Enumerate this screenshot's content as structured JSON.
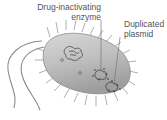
{
  "diagram": {
    "labels": {
      "enzyme": "Drug-inactivating enzyme",
      "enzyme_line1": "Drug-inactivating",
      "enzyme_line2": "enzyme",
      "plasmid_line1": "Duplicated",
      "plasmid_line2": "plasmid"
    },
    "elements": [
      "cell-body",
      "pili",
      "flagella",
      "nucleoid",
      "plasmids",
      "enzyme-dots"
    ],
    "colors": {
      "cell_fill": "#b8b8b8",
      "cell_edge": "#8a8a8a",
      "lines": "#777777",
      "text": "#555555"
    }
  }
}
